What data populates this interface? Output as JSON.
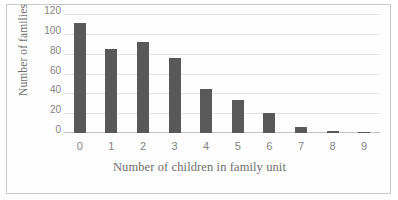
{
  "chart_data": {
    "type": "bar",
    "title": "",
    "subtitle": "",
    "xlabel": "Number of children in family unit",
    "ylabel": "Number of families",
    "categories": [
      "0",
      "1",
      "2",
      "3",
      "4",
      "5",
      "6",
      "7",
      "8",
      "9"
    ],
    "values": [
      111,
      85,
      92,
      76,
      44,
      33,
      20,
      6,
      2,
      1
    ],
    "series": [
      {
        "name": "Number of families",
        "values": [
          111,
          85,
          92,
          76,
          44,
          33,
          20,
          6,
          2,
          1
        ]
      }
    ],
    "ylim": [
      0,
      120
    ],
    "y_ticks": [
      0,
      20,
      40,
      60,
      80,
      100,
      120
    ],
    "y_tick_labels": [
      "0",
      "20",
      "40",
      "60",
      "80",
      "100",
      "120"
    ],
    "x_tick_labels": [
      "0",
      "1",
      "2",
      "3",
      "4",
      "5",
      "6",
      "7",
      "8",
      "9"
    ],
    "grid": true,
    "grid_axis": "y",
    "legend": false,
    "legend_position": "none",
    "annotations": [],
    "colors": {
      "bar": "#595959",
      "gridline": "#e6e6e6",
      "axis": "#c2c2c2",
      "tick_label": "#848484",
      "axis_title": "#6f6f6f",
      "border": "#c9c9c9",
      "background": "#fdfdfd"
    }
  }
}
